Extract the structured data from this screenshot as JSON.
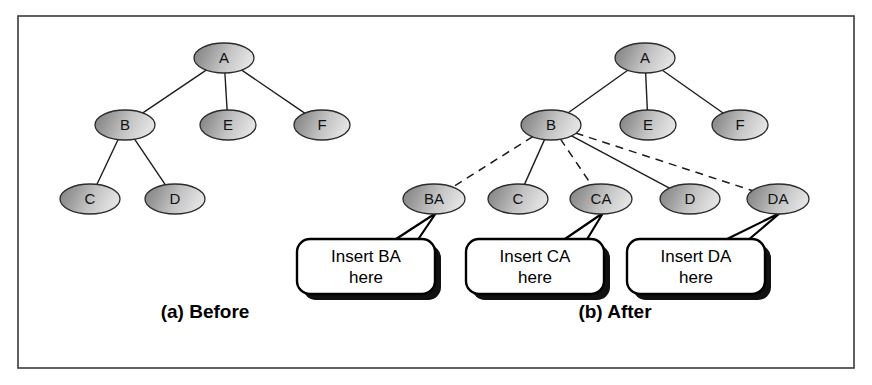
{
  "figure": {
    "background_color": "#ffffff",
    "frame_color": "#3a3a3a",
    "node_fill_dark": "#8b8b8b",
    "node_fill_light": "#d8d8d8",
    "node_outline": "#2b2b2b",
    "edge_color": "#1d1d1d",
    "callout_fill": "#ffffff",
    "callout_stroke": "#000000",
    "callout_shadow": "#111111"
  },
  "panels": [
    {
      "id": "before",
      "caption": "(a) Before",
      "caption_x": 205,
      "caption_y": 318,
      "nodes": [
        {
          "id": "A",
          "label": "A",
          "cx": 224,
          "cy": 58,
          "rx": 30,
          "ry": 15
        },
        {
          "id": "B",
          "label": "B",
          "cx": 125,
          "cy": 125,
          "rx": 30,
          "ry": 15
        },
        {
          "id": "E",
          "label": "E",
          "cx": 228,
          "cy": 125,
          "rx": 28,
          "ry": 15
        },
        {
          "id": "F",
          "label": "F",
          "cx": 322,
          "cy": 125,
          "rx": 28,
          "ry": 15
        },
        {
          "id": "C",
          "label": "C",
          "cx": 90,
          "cy": 199,
          "rx": 30,
          "ry": 15
        },
        {
          "id": "D",
          "label": "D",
          "cx": 175,
          "cy": 199,
          "rx": 30,
          "ry": 15
        }
      ],
      "edges": [
        {
          "from": "A",
          "to": "B",
          "style": "solid"
        },
        {
          "from": "A",
          "to": "E",
          "style": "solid"
        },
        {
          "from": "A",
          "to": "F",
          "style": "solid"
        },
        {
          "from": "B",
          "to": "C",
          "style": "solid"
        },
        {
          "from": "B",
          "to": "D",
          "style": "solid"
        }
      ],
      "callouts": []
    },
    {
      "id": "after",
      "caption": "(b) After",
      "caption_x": 615,
      "caption_y": 318,
      "nodes": [
        {
          "id": "A",
          "label": "A",
          "cx": 645,
          "cy": 58,
          "rx": 30,
          "ry": 15
        },
        {
          "id": "B",
          "label": "B",
          "cx": 551,
          "cy": 125,
          "rx": 30,
          "ry": 15
        },
        {
          "id": "E",
          "label": "E",
          "cx": 648,
          "cy": 125,
          "rx": 28,
          "ry": 15
        },
        {
          "id": "F",
          "label": "F",
          "cx": 740,
          "cy": 125,
          "rx": 28,
          "ry": 15
        },
        {
          "id": "BA",
          "label": "BA",
          "cx": 434,
          "cy": 199,
          "rx": 31,
          "ry": 15
        },
        {
          "id": "C",
          "label": "C",
          "cx": 518,
          "cy": 199,
          "rx": 30,
          "ry": 15
        },
        {
          "id": "CA",
          "label": "CA",
          "cx": 601,
          "cy": 199,
          "rx": 31,
          "ry": 15
        },
        {
          "id": "D",
          "label": "D",
          "cx": 690,
          "cy": 199,
          "rx": 30,
          "ry": 15
        },
        {
          "id": "DA",
          "label": "DA",
          "cx": 778,
          "cy": 199,
          "rx": 31,
          "ry": 15
        }
      ],
      "edges": [
        {
          "from": "A",
          "to": "B",
          "style": "solid"
        },
        {
          "from": "A",
          "to": "E",
          "style": "solid"
        },
        {
          "from": "A",
          "to": "F",
          "style": "solid"
        },
        {
          "from": "B",
          "to": "C",
          "style": "solid"
        },
        {
          "from": "B",
          "to": "D",
          "style": "solid"
        },
        {
          "from": "B",
          "to": "BA",
          "style": "dashed"
        },
        {
          "from": "B",
          "to": "CA",
          "style": "dashed"
        },
        {
          "from": "B",
          "to": "DA",
          "style": "dashed"
        }
      ],
      "callouts": [
        {
          "id": "callout-ba",
          "line1": "Insert BA",
          "line2": "here",
          "x": 297,
          "y": 239,
          "w": 138,
          "h": 55,
          "target_node": "BA"
        },
        {
          "id": "callout-ca",
          "line1": "Insert CA",
          "line2": "here",
          "x": 466,
          "y": 239,
          "w": 138,
          "h": 55,
          "target_node": "CA"
        },
        {
          "id": "callout-da",
          "line1": "Insert DA",
          "line2": "here",
          "x": 627,
          "y": 239,
          "w": 138,
          "h": 55,
          "target_node": "DA"
        }
      ]
    }
  ],
  "frame": {
    "x": 18,
    "y": 16,
    "w": 836,
    "h": 352
  },
  "caption_bottom": {
    "text": "",
    "x": 18,
    "y": 381
  }
}
